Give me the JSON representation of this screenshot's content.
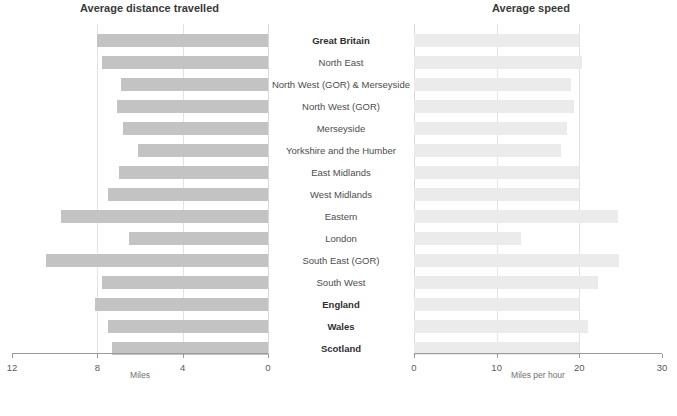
{
  "charts": {
    "left": {
      "title": "Average distance travelled",
      "axis_title": "Miles",
      "ticks": [
        "12",
        "8",
        "4",
        "0"
      ],
      "tick_values": [
        12,
        8,
        4,
        0
      ]
    },
    "right": {
      "title": "Average speed",
      "axis_title": "Miles per hour",
      "ticks": [
        "0",
        "10",
        "20",
        "30"
      ],
      "tick_values": [
        0,
        10,
        20,
        30
      ]
    }
  },
  "categories": [
    {
      "label": "Great Britain",
      "bold": true
    },
    {
      "label": "North East",
      "bold": false
    },
    {
      "label": "North West (GOR) & Merseyside",
      "bold": false
    },
    {
      "label": "North West (GOR)",
      "bold": false
    },
    {
      "label": "Merseyside",
      "bold": false
    },
    {
      "label": "Yorkshire and the Humber",
      "bold": false
    },
    {
      "label": "East Midlands",
      "bold": false
    },
    {
      "label": "West Midlands",
      "bold": false
    },
    {
      "label": "Eastern",
      "bold": false
    },
    {
      "label": "London",
      "bold": false
    },
    {
      "label": "South East (GOR)",
      "bold": false
    },
    {
      "label": "South West",
      "bold": false
    },
    {
      "label": "England",
      "bold": true
    },
    {
      "label": "Wales",
      "bold": true
    },
    {
      "label": "Scotland",
      "bold": true
    }
  ],
  "chart_data": [
    {
      "type": "bar",
      "orientation": "horizontal",
      "direction": "right-to-left",
      "title": "Average distance travelled",
      "xlabel": "Miles",
      "ylabel": "",
      "xlim": [
        12,
        0
      ],
      "grid": true,
      "categories": [
        "Great Britain",
        "North East",
        "North West (GOR) & Merseyside",
        "North West (GOR)",
        "Merseyside",
        "Yorkshire and the Humber",
        "East Midlands",
        "West Midlands",
        "Eastern",
        "London",
        "South East (GOR)",
        "South West",
        "England",
        "Wales",
        "Scotland"
      ],
      "values": [
        8.0,
        7.8,
        6.9,
        7.1,
        6.8,
        6.1,
        7.0,
        7.5,
        9.7,
        6.5,
        10.4,
        7.8,
        8.1,
        7.5,
        7.3
      ],
      "bar_color": "#c3c3c3"
    },
    {
      "type": "bar",
      "orientation": "horizontal",
      "direction": "left-to-right",
      "title": "Average speed",
      "xlabel": "Miles per hour",
      "ylabel": "",
      "xlim": [
        0,
        30
      ],
      "grid": true,
      "categories": [
        "Great Britain",
        "North East",
        "North West (GOR) & Merseyside",
        "North West (GOR)",
        "Merseyside",
        "Yorkshire and the Humber",
        "East Midlands",
        "West Midlands",
        "Eastern",
        "London",
        "South East (GOR)",
        "South West",
        "England",
        "Wales",
        "Scotland"
      ],
      "values": [
        20.0,
        20.3,
        19.0,
        19.3,
        18.5,
        17.8,
        20.0,
        19.9,
        24.7,
        12.9,
        24.8,
        22.3,
        20.0,
        21.0,
        20.0
      ],
      "bar_color": "#ebebeb"
    }
  ]
}
